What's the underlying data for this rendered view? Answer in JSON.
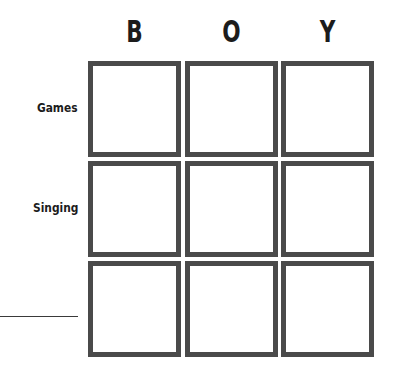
{
  "grid": {
    "columns": [
      {
        "label": "B"
      },
      {
        "label": "O"
      },
      {
        "label": "Y"
      }
    ],
    "rows": [
      {
        "label": "Games"
      },
      {
        "label": "Singing"
      },
      {
        "label": ""
      }
    ],
    "cells": [
      [
        "",
        "",
        ""
      ],
      [
        "",
        "",
        ""
      ],
      [
        "",
        "",
        ""
      ]
    ],
    "border_color": "#4a4a4a"
  }
}
